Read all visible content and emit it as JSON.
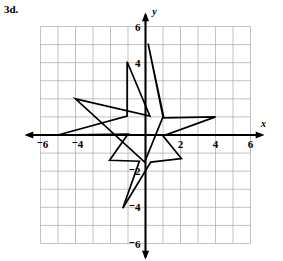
{
  "problem": {
    "label": "3d."
  },
  "chart_data": {
    "type": "scatter",
    "title": "",
    "xlabel": "x",
    "ylabel": "y",
    "xlim": [
      -6,
      6
    ],
    "ylim": [
      -6,
      6
    ],
    "grid": true,
    "grid_step": 1,
    "legend": "none",
    "x_tick_labels": [
      "⁻6",
      "⁻4",
      "2",
      "4",
      "6"
    ],
    "x_tick_values": [
      -6,
      -4,
      2,
      4,
      6
    ],
    "y_tick_labels": [
      "6",
      "4",
      "⁻2",
      "⁻4",
      "⁻6"
    ],
    "y_tick_values": [
      6,
      4,
      -2,
      -4,
      -6
    ],
    "annotations": [],
    "series": [
      {
        "name": "star-polygon",
        "closed": true,
        "points": [
          [
            0.15,
            5.05
          ],
          [
            1.05,
            0.95
          ],
          [
            4.0,
            1.0
          ],
          [
            1.0,
            -0.05
          ],
          [
            2.05,
            -1.3
          ],
          [
            0.3,
            -1.5
          ],
          [
            -1.3,
            -4.05
          ],
          [
            -0.35,
            -1.45
          ],
          [
            -2.05,
            -1.4
          ],
          [
            -1.0,
            0.05
          ],
          [
            -5.0,
            0.0
          ],
          [
            -1.05,
            1.05
          ],
          [
            -1.05,
            4.05
          ],
          [
            0.25,
            1.05
          ],
          [
            -4.0,
            2.0
          ],
          [
            -0.05,
            -1.5
          ],
          [
            1.0,
            1.0
          ]
        ]
      }
    ]
  },
  "axes": {
    "x_axis_name": "x",
    "y_axis_name": "y"
  }
}
